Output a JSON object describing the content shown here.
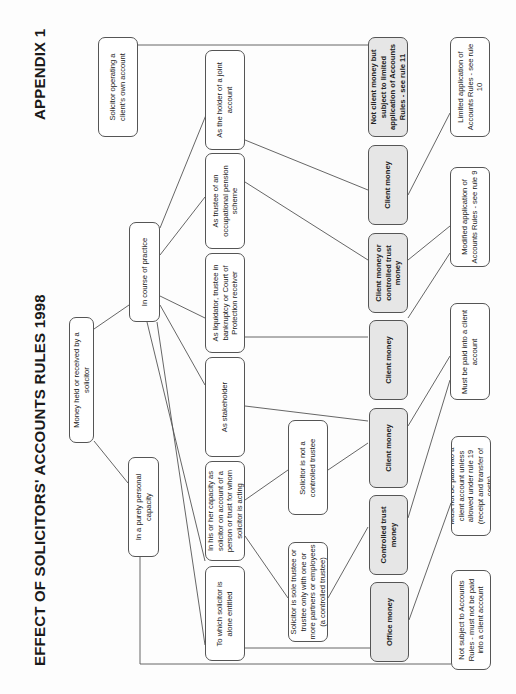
{
  "header": {
    "title": "EFFECT OF SOLICITORS' ACCOUNTS RULES 1998",
    "appendix": "APPENDIX 1"
  },
  "nodes": {
    "root": {
      "label": "Money held or received by a solicitor",
      "x": 69,
      "y": 317,
      "w": 25,
      "h": 126,
      "shaded": false,
      "tw": 120
    },
    "practice": {
      "label": "In course of practice",
      "x": 129,
      "y": 222,
      "w": 31,
      "h": 100,
      "shaded": false,
      "tw": 96
    },
    "personal": {
      "label": "In a purely personal capacity",
      "x": 128,
      "y": 457,
      "w": 31,
      "h": 100,
      "shaded": false,
      "tw": 96
    },
    "own_account": {
      "label": "Solicitor operating a client's own account",
      "x": 98,
      "y": 37,
      "w": 40,
      "h": 100,
      "shaded": false,
      "tw": 92
    },
    "joint": {
      "label": "As the holder of a joint account",
      "x": 205,
      "y": 50,
      "w": 40,
      "h": 100,
      "shaded": false,
      "tw": 94
    },
    "pension": {
      "label": "As trustee of an occupational pension scheme",
      "x": 205,
      "y": 153,
      "w": 40,
      "h": 96,
      "shaded": false,
      "tw": 90
    },
    "liquidator": {
      "label": "As liquidator, trustee in bankruptcy or Court of Protection receiver",
      "x": 205,
      "y": 253,
      "w": 40,
      "h": 100,
      "shaded": false,
      "tw": 94
    },
    "stakeholder": {
      "label": "As stakeholder",
      "x": 205,
      "y": 357,
      "w": 40,
      "h": 100,
      "shaded": false,
      "tw": 94
    },
    "capacity": {
      "label": "In his or her capacity as solicitor on account of a person or trust for whom solicitor is acting",
      "x": 205,
      "y": 461,
      "w": 40,
      "h": 100,
      "shaded": false,
      "tw": 96
    },
    "alone": {
      "label": "To which solicitor is alone entitled",
      "x": 205,
      "y": 566,
      "w": 40,
      "h": 95,
      "shaded": false,
      "tw": 84
    },
    "not_controlled": {
      "label": "Solicitor is not a controlled trustee",
      "x": 288,
      "y": 420,
      "w": 40,
      "h": 95,
      "shaded": false,
      "tw": 86
    },
    "sole_trustee": {
      "label": "Solicitor is sole trustee or trustee only with one or more partners or employees (a controlled trustee)",
      "x": 288,
      "y": 542,
      "w": 40,
      "h": 100,
      "shaded": false,
      "tw": 96
    },
    "not_client_money": {
      "label": "Not client money but subject to limited application of Accounts Rules - see rule 11",
      "x": 368,
      "y": 37,
      "w": 40,
      "h": 100,
      "shaded": true,
      "tw": 96
    },
    "client_money_joint": {
      "label": "Client money",
      "x": 368,
      "y": 145,
      "w": 40,
      "h": 80,
      "shaded": true,
      "tw": 76
    },
    "client_or_controlled": {
      "label": "Client money or controlled trust money",
      "x": 368,
      "y": 233,
      "w": 40,
      "h": 80,
      "shaded": true,
      "tw": 76
    },
    "client_money_liq": {
      "label": "Client money",
      "x": 369,
      "y": 320,
      "w": 39,
      "h": 80,
      "shaded": true,
      "tw": 76
    },
    "client_money_stake": {
      "label": "Client money",
      "x": 369,
      "y": 408,
      "w": 39,
      "h": 80,
      "shaded": true,
      "tw": 76
    },
    "controlled_trust": {
      "label": "Controlled trust money",
      "x": 369,
      "y": 495,
      "w": 39,
      "h": 80,
      "shaded": true,
      "tw": 76
    },
    "office_money": {
      "label": "Office money",
      "x": 370,
      "y": 582,
      "w": 39,
      "h": 80,
      "shaded": true,
      "tw": 76
    },
    "rule10": {
      "label": "Limited application of Accounts Rules - see rule 10",
      "x": 450,
      "y": 37,
      "w": 40,
      "h": 100,
      "shaded": false,
      "tw": 94
    },
    "rule9": {
      "label": "Modified application of Accounts Rules - see rule 9",
      "x": 450,
      "y": 167,
      "w": 40,
      "h": 100,
      "shaded": false,
      "tw": 94
    },
    "must_paid": {
      "label": "Must be paid into a client account",
      "x": 450,
      "y": 303,
      "w": 40,
      "h": 97,
      "shaded": false,
      "tw": 90
    },
    "must_not_paid": {
      "label": "Must not be paid into a client account unless allowed under rule 19 (receipt and transfer of costs)",
      "x": 451,
      "y": 436,
      "w": 40,
      "h": 100,
      "shaded": false,
      "tw": 96
    },
    "not_subject": {
      "label": "Not subject to Accounts Rules - must not be paid into a client account",
      "x": 451,
      "y": 570,
      "w": 40,
      "h": 100,
      "shaded": false,
      "tw": 96
    }
  },
  "edges": [
    [
      94,
      329,
      129,
      305
    ],
    [
      94,
      441,
      128,
      483
    ],
    [
      160,
      228,
      206,
      115
    ],
    [
      160,
      255,
      205,
      197
    ],
    [
      160,
      296,
      205,
      318
    ],
    [
      160,
      305,
      205,
      385
    ],
    [
      147,
      322,
      205,
      561
    ],
    [
      157,
      322,
      205,
      645
    ],
    [
      137,
      45,
      368,
      45
    ],
    [
      245,
      140,
      368,
      190
    ],
    [
      245,
      182,
      368,
      260
    ],
    [
      245,
      337,
      368,
      337
    ],
    [
      245,
      406,
      368,
      421
    ],
    [
      245,
      500,
      288,
      470
    ],
    [
      245,
      536,
      288,
      598
    ],
    [
      328,
      470,
      368,
      443
    ],
    [
      328,
      598,
      368,
      527
    ],
    [
      245,
      648,
      370,
      648
    ],
    [
      408,
      195,
      450,
      113
    ],
    [
      408,
      260,
      450,
      226
    ],
    [
      408,
      318,
      450,
      253
    ],
    [
      408,
      426,
      450,
      356
    ],
    [
      408,
      518,
      450,
      380
    ],
    [
      409,
      620,
      451,
      503
    ]
  ],
  "personal_route": [
    [
      140,
      557
    ],
    [
      140,
      664
    ],
    [
      451,
      664
    ]
  ]
}
